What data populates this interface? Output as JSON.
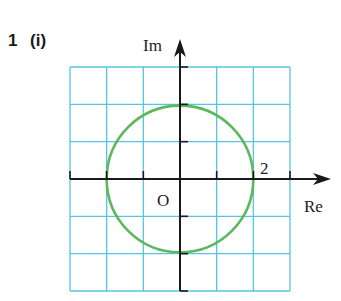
{
  "question": {
    "number": "1",
    "part": "(i)"
  },
  "diagram": {
    "type": "argand-diagram",
    "axes": {
      "real_label": "Re",
      "imag_label": "Im",
      "origin_label": "O",
      "x_range": [
        -3,
        3
      ],
      "y_range": [
        -3,
        3
      ]
    },
    "grid": {
      "columns": 6,
      "rows": 6,
      "color": "#55c6e2"
    },
    "circle": {
      "center": [
        0,
        0
      ],
      "radius": 2,
      "color": "#5cb85c"
    },
    "annotations": [
      {
        "text": "2",
        "at": [
          2,
          0
        ]
      }
    ],
    "axis_color": "#1a1a1a"
  }
}
